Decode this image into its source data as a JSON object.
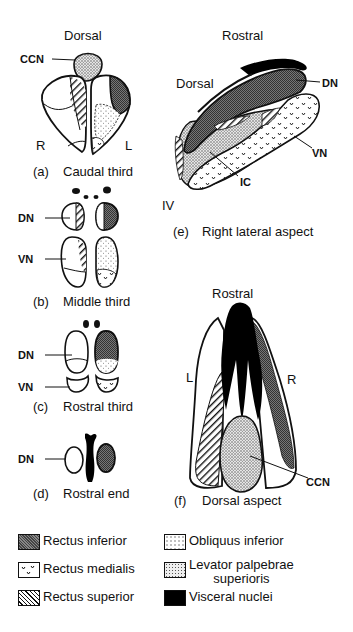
{
  "panels": {
    "a": {
      "letter": "(a)",
      "caption": "Caudal third",
      "top_label": "Dorsal",
      "ccn": "CCN",
      "left": "R",
      "right": "L"
    },
    "b": {
      "letter": "(b)",
      "caption": "Middle third",
      "dn": "DN",
      "vn": "VN"
    },
    "c": {
      "letter": "(c)",
      "caption": "Rostral third",
      "dn": "DN",
      "vn": "VN"
    },
    "d": {
      "letter": "(d)",
      "caption": "Rostral end",
      "dn": "DN"
    },
    "e": {
      "letter": "(e)",
      "caption": "Right lateral aspect",
      "top_label": "Rostral",
      "side_label": "Dorsal",
      "dn": "DN",
      "vn": "VN",
      "ic": "IC",
      "iv": "IV"
    },
    "f": {
      "letter": "(f)",
      "caption": "Dorsal aspect",
      "top_label": "Rostral",
      "left": "L",
      "right": "R",
      "ccn": "CCN"
    }
  },
  "legend": {
    "items": [
      {
        "label": "Rectus inferior",
        "pattern": "dense-crosshatch"
      },
      {
        "label": "Obliquus inferior",
        "pattern": "sparse-dots"
      },
      {
        "label": "Rectus medialis",
        "pattern": "v-marks"
      },
      {
        "label": "Levator palpebrae superioris",
        "line1": "Levator palpebrae",
        "line2": "superioris",
        "pattern": "dense-stipple"
      },
      {
        "label": "Rectus superior",
        "pattern": "diagonal-hatch"
      },
      {
        "label": "Visceral nuclei",
        "pattern": "solid-black"
      }
    ]
  }
}
